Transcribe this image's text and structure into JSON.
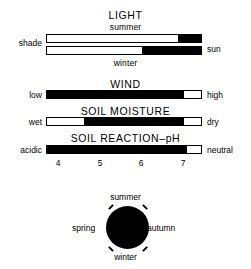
{
  "diagram": {
    "sections": [
      {
        "id": "light",
        "title": "LIGHT",
        "sub_top": "summer",
        "sub_bottom": "winter",
        "left_label": "shade",
        "right_label": "sun",
        "bars": [
          {
            "id": "light-summer",
            "season": "summer",
            "fill_start_pct": 0,
            "fill_end_pct": 0,
            "black_from_pct": 85,
            "black_to_pct": 100
          },
          {
            "id": "light-winter",
            "season": "winter",
            "fill_start_pct": 0,
            "fill_end_pct": 0,
            "black_from_pct": 62,
            "black_to_pct": 100
          }
        ]
      },
      {
        "id": "wind",
        "title": "WIND",
        "left_label": "low",
        "right_label": "high",
        "bars": [
          {
            "id": "wind-range",
            "black_from_pct": 0,
            "black_to_pct": 89
          }
        ]
      },
      {
        "id": "soil-moisture",
        "title": "SOIL MOISTURE",
        "left_label": "wet",
        "right_label": "dry",
        "bars": [
          {
            "id": "soil-moisture-range",
            "black_from_pct": 24,
            "black_to_pct": 89
          }
        ]
      },
      {
        "id": "soil-reaction",
        "title": "SOIL REACTION–pH",
        "left_label": "acidic",
        "right_label": "neutral",
        "bars": [
          {
            "id": "soil-reaction-range",
            "black_from_pct": 0,
            "black_to_pct": 91
          }
        ],
        "axis": {
          "ticks": [
            {
              "label": "4",
              "pos_pct": 8
            },
            {
              "label": "5",
              "pos_pct": 35
            },
            {
              "label": "6",
              "pos_pct": 61
            },
            {
              "label": "7",
              "pos_pct": 88
            }
          ]
        }
      }
    ],
    "seasons_circle": {
      "top": "summer",
      "right": "autumn",
      "bottom": "winter",
      "left": "spring",
      "fill_color": "#000000",
      "fill_fraction": 1.0
    }
  }
}
